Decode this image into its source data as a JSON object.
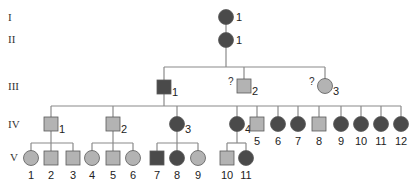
{
  "colors": {
    "affected": "#4a4a4a",
    "unaffected": "#b3b3b3",
    "outline": "#5a5a5a",
    "line": "#8a8a8a"
  },
  "generations": [
    {
      "label": "I",
      "x": 8,
      "y": 21
    },
    {
      "label": "II",
      "x": 8,
      "y": 43
    },
    {
      "label": "III",
      "x": 8,
      "y": 90
    },
    {
      "label": "IV",
      "x": 8,
      "y": 128
    },
    {
      "label": "V",
      "x": 10,
      "y": 161
    }
  ],
  "individuals": [
    {
      "id": "I-1",
      "gen": "I",
      "num": "1",
      "sex": "female",
      "status": "affected",
      "cx": 226,
      "cy": 17,
      "label_pos": "right"
    },
    {
      "id": "II-1",
      "gen": "II",
      "num": "1",
      "sex": "female",
      "status": "affected",
      "cx": 226,
      "cy": 40,
      "label_pos": "right"
    },
    {
      "id": "III-1",
      "gen": "III",
      "num": "1",
      "sex": "male",
      "status": "affected",
      "cx": 164,
      "cy": 87,
      "label_pos": "right-low"
    },
    {
      "id": "III-2",
      "gen": "III",
      "num": "2",
      "sex": "male",
      "status": "unaffected",
      "cx": 244,
      "cy": 86,
      "label_pos": "right-low",
      "question": "?"
    },
    {
      "id": "III-3",
      "gen": "III",
      "num": "3",
      "sex": "female",
      "status": "unaffected",
      "cx": 325,
      "cy": 86,
      "label_pos": "right-low",
      "question": "?"
    },
    {
      "id": "IV-1",
      "gen": "IV",
      "num": "1",
      "sex": "male",
      "status": "unaffected",
      "cx": 51,
      "cy": 124,
      "label_pos": "right-low"
    },
    {
      "id": "IV-2",
      "gen": "IV",
      "num": "2",
      "sex": "male",
      "status": "unaffected",
      "cx": 113,
      "cy": 124,
      "label_pos": "right-low"
    },
    {
      "id": "IV-3",
      "gen": "IV",
      "num": "3",
      "sex": "female",
      "status": "affected",
      "cx": 177,
      "cy": 124,
      "label_pos": "right-low"
    },
    {
      "id": "IV-4",
      "gen": "IV",
      "num": "4",
      "sex": "female",
      "status": "affected",
      "cx": 237,
      "cy": 124,
      "label_pos": "right-low"
    },
    {
      "id": "IV-5",
      "gen": "IV",
      "num": "5",
      "sex": "male",
      "status": "unaffected",
      "cx": 257,
      "cy": 124,
      "label_pos": "below"
    },
    {
      "id": "IV-6",
      "gen": "IV",
      "num": "6",
      "sex": "female",
      "status": "affected",
      "cx": 278,
      "cy": 124,
      "label_pos": "below"
    },
    {
      "id": "IV-7",
      "gen": "IV",
      "num": "7",
      "sex": "female",
      "status": "affected",
      "cx": 298,
      "cy": 124,
      "label_pos": "below"
    },
    {
      "id": "IV-8",
      "gen": "IV",
      "num": "8",
      "sex": "male",
      "status": "unaffected",
      "cx": 319,
      "cy": 124,
      "label_pos": "below"
    },
    {
      "id": "IV-9",
      "gen": "IV",
      "num": "9",
      "sex": "female",
      "status": "affected",
      "cx": 341,
      "cy": 124,
      "label_pos": "below"
    },
    {
      "id": "IV-10",
      "gen": "IV",
      "num": "10",
      "sex": "female",
      "status": "affected",
      "cx": 361,
      "cy": 124,
      "label_pos": "below"
    },
    {
      "id": "IV-11",
      "gen": "IV",
      "num": "11",
      "sex": "female",
      "status": "affected",
      "cx": 381,
      "cy": 124,
      "label_pos": "below"
    },
    {
      "id": "IV-12",
      "gen": "IV",
      "num": "12",
      "sex": "female",
      "status": "affected",
      "cx": 401,
      "cy": 124,
      "label_pos": "below"
    },
    {
      "id": "V-1",
      "gen": "V",
      "num": "1",
      "sex": "female",
      "status": "unaffected",
      "cx": 31,
      "cy": 158,
      "label_pos": "below"
    },
    {
      "id": "V-2",
      "gen": "V",
      "num": "2",
      "sex": "male",
      "status": "unaffected",
      "cx": 51,
      "cy": 158,
      "label_pos": "below"
    },
    {
      "id": "V-3",
      "gen": "V",
      "num": "3",
      "sex": "male",
      "status": "unaffected",
      "cx": 73,
      "cy": 158,
      "label_pos": "below"
    },
    {
      "id": "V-4",
      "gen": "V",
      "num": "4",
      "sex": "female",
      "status": "unaffected",
      "cx": 92,
      "cy": 158,
      "label_pos": "below"
    },
    {
      "id": "V-5",
      "gen": "V",
      "num": "5",
      "sex": "male",
      "status": "unaffected",
      "cx": 113,
      "cy": 158,
      "label_pos": "below"
    },
    {
      "id": "V-6",
      "gen": "V",
      "num": "6",
      "sex": "female",
      "status": "unaffected",
      "cx": 133,
      "cy": 158,
      "label_pos": "below"
    },
    {
      "id": "V-7",
      "gen": "V",
      "num": "7",
      "sex": "male",
      "status": "affected",
      "cx": 157,
      "cy": 158,
      "label_pos": "below"
    },
    {
      "id": "V-8",
      "gen": "V",
      "num": "8",
      "sex": "female",
      "status": "affected",
      "cx": 177,
      "cy": 158,
      "label_pos": "below"
    },
    {
      "id": "V-9",
      "gen": "V",
      "num": "9",
      "sex": "female",
      "status": "unaffected",
      "cx": 198,
      "cy": 158,
      "label_pos": "below"
    },
    {
      "id": "V-10",
      "gen": "V",
      "num": "10",
      "sex": "male",
      "status": "unaffected",
      "cx": 227,
      "cy": 158,
      "label_pos": "below"
    },
    {
      "id": "V-11",
      "gen": "V",
      "num": "11",
      "sex": "female",
      "status": "affected",
      "cx": 246,
      "cy": 158,
      "label_pos": "below"
    }
  ],
  "lines": [
    [
      226,
      24,
      226,
      33
    ],
    [
      226,
      47,
      226,
      67
    ],
    [
      164,
      67,
      325,
      67
    ],
    [
      164,
      67,
      164,
      80
    ],
    [
      244,
      67,
      244,
      79
    ],
    [
      325,
      67,
      325,
      79
    ],
    [
      164,
      94,
      164,
      106
    ],
    [
      51,
      106,
      401,
      106
    ],
    [
      51,
      106,
      51,
      117
    ],
    [
      113,
      106,
      113,
      117
    ],
    [
      177,
      106,
      177,
      117
    ],
    [
      237,
      106,
      237,
      117
    ],
    [
      257,
      106,
      257,
      117
    ],
    [
      278,
      106,
      278,
      117
    ],
    [
      298,
      106,
      298,
      117
    ],
    [
      319,
      106,
      319,
      117
    ],
    [
      341,
      106,
      341,
      117
    ],
    [
      361,
      106,
      361,
      117
    ],
    [
      381,
      106,
      381,
      117
    ],
    [
      401,
      106,
      401,
      117
    ],
    [
      51,
      131,
      51,
      143
    ],
    [
      31,
      143,
      73,
      143
    ],
    [
      31,
      143,
      31,
      151
    ],
    [
      51,
      143,
      51,
      151
    ],
    [
      73,
      143,
      73,
      151
    ],
    [
      113,
      131,
      113,
      143
    ],
    [
      92,
      143,
      133,
      143
    ],
    [
      92,
      143,
      92,
      151
    ],
    [
      113,
      143,
      113,
      151
    ],
    [
      133,
      143,
      133,
      151
    ],
    [
      177,
      131,
      177,
      143
    ],
    [
      157,
      143,
      198,
      143
    ],
    [
      157,
      143,
      157,
      151
    ],
    [
      177,
      143,
      177,
      151
    ],
    [
      198,
      143,
      198,
      151
    ],
    [
      237,
      131,
      237,
      143
    ],
    [
      227,
      143,
      246,
      143
    ],
    [
      227,
      143,
      227,
      151
    ],
    [
      246,
      143,
      246,
      151
    ]
  ]
}
